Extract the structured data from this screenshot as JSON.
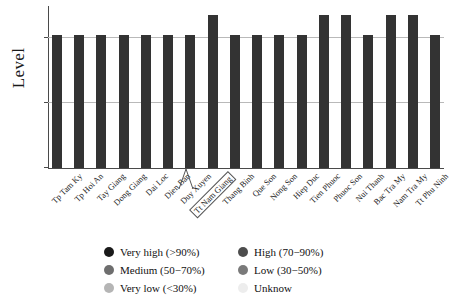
{
  "chart_data": {
    "type": "bar",
    "title": "",
    "xlabel": "",
    "ylabel": "Level",
    "grid": true,
    "legend_position": "bottom",
    "ylim": [
      0,
      110
    ],
    "yticks_visible": false,
    "gridline_values": [
      90,
      50
    ],
    "categories": [
      "Tp Tam Ky",
      "Tp Hoi An",
      "Tay Giang",
      "Dong Giang",
      "Dai Loc",
      "Dien Ban",
      "Duy Xuyen",
      "Tt Nam Giang",
      "Thang Binh",
      "Que Son",
      "Nong Son",
      "Hiep Duc",
      "Tien Phuoc",
      "Phuoc Son",
      "Nui Thanh",
      "Bac Tra My",
      "Nam Tra My",
      "Tt Phu Ninh"
    ],
    "values": [
      90,
      90,
      90,
      90,
      90,
      90,
      90,
      104,
      90,
      90,
      90,
      90,
      104,
      104,
      90,
      104,
      104,
      90
    ],
    "bar_color": "#333333",
    "highlighted_category": "Tt Nam Giang"
  },
  "axis": {
    "y_title": "Level"
  },
  "legend": {
    "items": [
      {
        "label": "Very high (>90%)",
        "color": "#1a1a1a"
      },
      {
        "label": "High (70−90%)",
        "color": "#4d4d4d"
      },
      {
        "label": "Medium (50−70%)",
        "color": "#6e6e6e"
      },
      {
        "label": "Low (30−50%)",
        "color": "#7a7a7a"
      },
      {
        "label": "Very low (<30%)",
        "color": "#b5b5b5"
      },
      {
        "label": "Unknow",
        "color": "#ededed"
      }
    ]
  }
}
